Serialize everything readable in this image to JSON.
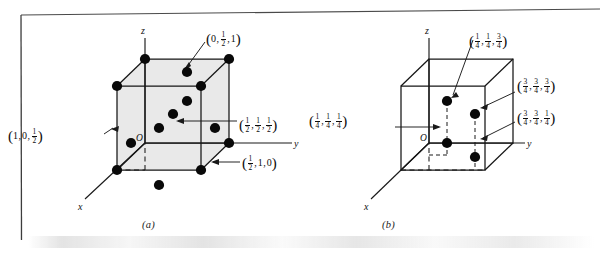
{
  "figure": {
    "panels": [
      {
        "id": "a",
        "caption": "(a)",
        "cell_type": "face-centered cubic",
        "shaded": true,
        "fill_color": "#e9e9e9",
        "line_color": "#161616",
        "dot_color": "#0a0a0a",
        "origin_label": "O",
        "axes": [
          {
            "name": "z-axis-label",
            "label": "z"
          },
          {
            "name": "y-axis-label",
            "label": "y"
          },
          {
            "name": "x-axis-label",
            "label": "x"
          }
        ],
        "labels": [
          {
            "name": "coord-label-0-half-1",
            "text": "(0, 1/2, 1)",
            "parts": [
              {
                "type": "whole",
                "value": "0"
              },
              {
                "type": "frac",
                "num": "1",
                "den": "2"
              },
              {
                "type": "whole",
                "value": "1"
              }
            ]
          },
          {
            "name": "coord-label-1-0-half",
            "text": "(1, 0, 1/2)",
            "parts": [
              {
                "type": "whole",
                "value": "1"
              },
              {
                "type": "whole",
                "value": "0"
              },
              {
                "type": "frac",
                "num": "1",
                "den": "2"
              }
            ]
          },
          {
            "name": "coord-label-half-half-half",
            "text": "(1/2, 1/2, 1/2)",
            "parts": [
              {
                "type": "frac",
                "num": "1",
                "den": "2"
              },
              {
                "type": "frac",
                "num": "1",
                "den": "2"
              },
              {
                "type": "frac",
                "num": "1",
                "den": "2"
              }
            ]
          },
          {
            "name": "coord-label-half-1-0",
            "text": "(1/2, 1, 0)",
            "parts": [
              {
                "type": "frac",
                "num": "1",
                "den": "2"
              },
              {
                "type": "whole",
                "value": "1"
              },
              {
                "type": "whole",
                "value": "0"
              }
            ]
          }
        ],
        "atom_count": 14
      },
      {
        "id": "b",
        "caption": "(b)",
        "cell_type": "diamond cubic interior sites",
        "shaded": false,
        "fill_color": "#ffffff",
        "line_color": "#161616",
        "dot_color": "#0a0a0a",
        "origin_label": "O",
        "axes": [
          {
            "name": "z-axis-label",
            "label": "z"
          },
          {
            "name": "y-axis-label",
            "label": "y"
          },
          {
            "name": "x-axis-label",
            "label": "x"
          }
        ],
        "labels": [
          {
            "name": "coord-label-quarter-quarter-threequarter",
            "text": "(1/4, 1/4, 3/4)",
            "parts": [
              {
                "type": "frac",
                "num": "1",
                "den": "4"
              },
              {
                "type": "frac",
                "num": "1",
                "den": "4"
              },
              {
                "type": "frac",
                "num": "3",
                "den": "4"
              }
            ]
          },
          {
            "name": "coord-label-threequarter-threequarter-threequarter",
            "text": "(3/4, 3/4, 3/4)",
            "parts": [
              {
                "type": "frac",
                "num": "3",
                "den": "4"
              },
              {
                "type": "frac",
                "num": "3",
                "den": "4"
              },
              {
                "type": "frac",
                "num": "3",
                "den": "4"
              }
            ]
          },
          {
            "name": "coord-label-threequarter-threequarter-quarter",
            "text": "(3/4, 3/4, 1/4)",
            "parts": [
              {
                "type": "frac",
                "num": "3",
                "den": "4"
              },
              {
                "type": "frac",
                "num": "3",
                "den": "4"
              },
              {
                "type": "frac",
                "num": "1",
                "den": "4"
              }
            ]
          },
          {
            "name": "coord-label-quarter-quarter-quarter",
            "text": "(1/4, 1/4, 1/4)",
            "parts": [
              {
                "type": "frac",
                "num": "1",
                "den": "4"
              },
              {
                "type": "frac",
                "num": "1",
                "den": "4"
              },
              {
                "type": "frac",
                "num": "1",
                "den": "4"
              }
            ]
          }
        ],
        "atom_count": 4
      }
    ]
  }
}
